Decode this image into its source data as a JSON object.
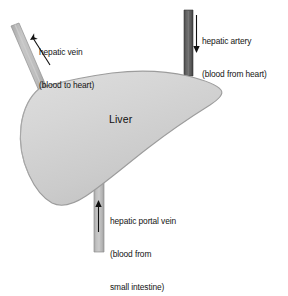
{
  "diagram": {
    "organ": {
      "name": "liver-body",
      "label": "Liver"
    },
    "vessels": [
      {
        "id": "hepatic-vein",
        "label_line1": "hepatic vein",
        "label_line2": "(blood to heart)",
        "flow_direction": "out-of-liver",
        "arrow_name": "hepatic-vein-arrow",
        "color": "#b9b9b9"
      },
      {
        "id": "hepatic-artery",
        "label_line1": "hepatic artery",
        "label_line2": "(blood from heart)",
        "flow_direction": "into-liver",
        "arrow_name": "hepatic-artery-arrow",
        "color": "#5a5a5a"
      },
      {
        "id": "hepatic-portal-vein",
        "label_line1": "hepatic portal vein",
        "label_line2": "(blood from",
        "label_line3": "small intestine)",
        "flow_direction": "into-liver",
        "arrow_name": "hepatic-portal-vein-arrow",
        "color": "#b9b9b9"
      }
    ],
    "colors": {
      "background": "#ffffff",
      "liver_fill": "#d6d6d6",
      "liver_edge": "#9a9a9a",
      "vessel_light": "#b9b9b9",
      "vessel_dark": "#5a5a5a",
      "arrow": "#111111",
      "text": "#141414"
    }
  }
}
